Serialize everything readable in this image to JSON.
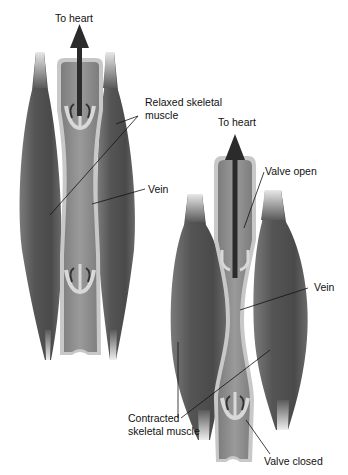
{
  "diagram": {
    "left_panel": {
      "state": "relaxed",
      "labels": {
        "to_heart": "To heart",
        "muscle_line1": "Relaxed skeletal",
        "muscle_line2": "muscle",
        "vein": "Vein"
      }
    },
    "right_panel": {
      "state": "contracted",
      "labels": {
        "to_heart": "To heart",
        "valve_open": "Valve open",
        "vein": "Vein",
        "muscle_line1": "Contracted",
        "muscle_line2": "skeletal muscle",
        "valve_closed": "Valve closed"
      }
    },
    "colors": {
      "muscle_dark": "#4a4a4a",
      "muscle_mid": "#6e6e6e",
      "vein_wall": "#c9c9c9",
      "vein_lumen": "#8a8a8a",
      "arrow": "#2b2b2b",
      "background": "#ffffff"
    }
  }
}
